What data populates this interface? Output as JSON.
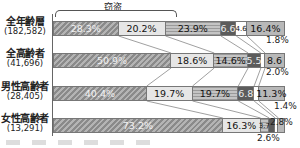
{
  "chart_data": {
    "type": "bar",
    "orientation": "horizontal",
    "stacked": true,
    "percent": true,
    "title": "",
    "annotation": "窃盗",
    "annotation_spans": [
      "segment 1",
      "segment 2"
    ],
    "categories": [
      "全年齢層",
      "全高齢者",
      "男性高齢者",
      "女性高齢者"
    ],
    "counts": [
      "(182,582)",
      "(41,696)",
      "(28,405)",
      "(13,291)"
    ],
    "series": [
      {
        "name": "窃盗(万引き)",
        "values": [
          28.3,
          50.9,
          40.4,
          73.2
        ]
      },
      {
        "name": "窃盗(その他)",
        "values": [
          20.2,
          18.6,
          19.7,
          16.3
        ]
      },
      {
        "name": "区分3",
        "values": [
          23.9,
          14.6,
          19.7,
          3.7
        ]
      },
      {
        "name": "区分4",
        "values": [
          6.6,
          5.5,
          6.8,
          2.6
        ]
      },
      {
        "name": "区分5",
        "values": [
          4.6,
          1.8,
          2.0,
          1.4
        ]
      },
      {
        "name": "区分6",
        "values": [
          16.4,
          8.6,
          11.3,
          2.8
        ]
      }
    ],
    "xlim": [
      0,
      100
    ],
    "grid": false,
    "legend_position": "bottom"
  },
  "bracket_label": "窃盗",
  "rows": [
    {
      "name": "全年齢層",
      "n": "(182,582)",
      "segs": [
        {
          "w": 28.3,
          "label": "28.3%",
          "cls": "c0"
        },
        {
          "w": 20.2,
          "label": "20.2%",
          "cls": "c1"
        },
        {
          "w": 23.9,
          "label": "23.9%",
          "cls": "c2"
        },
        {
          "w": 6.6,
          "label": "6.6",
          "cls": "c3"
        },
        {
          "w": 4.6,
          "label": "4.6",
          "cls": "c4 tiny"
        },
        {
          "w": 16.4,
          "label": "16.4%",
          "cls": "c5"
        }
      ]
    },
    {
      "name": "全高齢者",
      "n": "(41,696)",
      "segs": [
        {
          "w": 50.9,
          "label": "50.9%",
          "cls": "c0"
        },
        {
          "w": 18.6,
          "label": "18.6%",
          "cls": "c1"
        },
        {
          "w": 14.6,
          "label": "14.6%",
          "cls": "c2"
        },
        {
          "w": 5.5,
          "label": "5.5",
          "cls": "c3"
        },
        {
          "w": 1.8,
          "label": "",
          "cls": "c4"
        },
        {
          "w": 8.6,
          "label": "8.6",
          "cls": "c5"
        }
      ]
    },
    {
      "name": "男性高齢者",
      "n": "(28,405)",
      "segs": [
        {
          "w": 40.4,
          "label": "40.4%",
          "cls": "c0"
        },
        {
          "w": 19.7,
          "label": "19.7%",
          "cls": "c1"
        },
        {
          "w": 19.7,
          "label": "19.7%",
          "cls": "c2"
        },
        {
          "w": 6.8,
          "label": "6.8",
          "cls": "c3"
        },
        {
          "w": 2.0,
          "label": "",
          "cls": "c4"
        },
        {
          "w": 11.3,
          "label": "11.3%",
          "cls": "c5"
        }
      ]
    },
    {
      "name": "女性高齢者",
      "n": "(13,291)",
      "segs": [
        {
          "w": 73.2,
          "label": "73.2%",
          "cls": "c0"
        },
        {
          "w": 16.3,
          "label": "16.3%",
          "cls": "c1"
        },
        {
          "w": 3.7,
          "label": "3.7",
          "cls": "c2 tiny"
        },
        {
          "w": 2.6,
          "label": "",
          "cls": "c3"
        },
        {
          "w": 1.4,
          "label": "",
          "cls": "c4"
        },
        {
          "w": 2.8,
          "label": "",
          "cls": "c5"
        }
      ]
    }
  ],
  "outside_labels": [
    {
      "text": "1.8%",
      "x": 266,
      "y": 37
    },
    {
      "text": "2.0%",
      "x": 266,
      "y": 69
    },
    {
      "text": "1.4%",
      "x": 274,
      "y": 103
    },
    {
      "text": "2.8%",
      "x": 270,
      "y": 119
    },
    {
      "text": "2.6%",
      "x": 257,
      "y": 135
    }
  ]
}
